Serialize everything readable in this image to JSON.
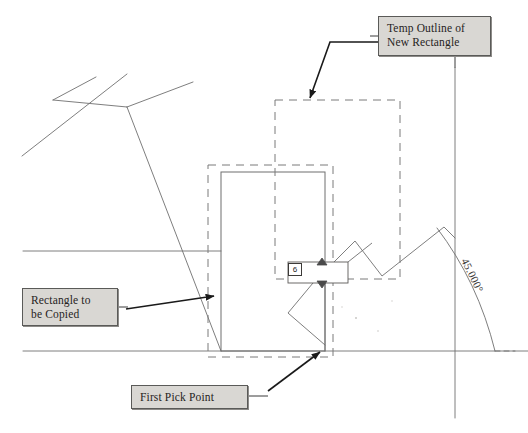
{
  "document": {
    "title": "Copy Rectangle Operation Diagram",
    "background_color": "#ffffff",
    "line_color": "#6b6b6b",
    "dash_color": "#7a7a7a",
    "arrow_color": "#1a1a1a",
    "callout_fill": "#d9d7d3",
    "callout_border": "#5a5a58"
  },
  "callouts": [
    {
      "id": "temp-outline",
      "text": "Temp Outline of\nNew Rectangle",
      "x": 378,
      "y": 16,
      "width": 113,
      "height": 40
    },
    {
      "id": "rectangle-to-be-copied",
      "text": "Rectangle to\nbe Copied",
      "x": 22,
      "y": 288,
      "width": 96,
      "height": 38
    },
    {
      "id": "first-pick-point",
      "text": "First Pick Point",
      "x": 131,
      "y": 385,
      "width": 117,
      "height": 24
    }
  ],
  "input_field": {
    "name": "coordinate-entry-field",
    "value": "6",
    "x": 288,
    "y": 263,
    "width": 14,
    "height": 13
  },
  "dimension": {
    "angle_label": "45.000°",
    "angle_degrees": 45
  },
  "geometry": {
    "source_rectangle": {
      "style": "solid",
      "x": 221,
      "y": 172,
      "width": 104,
      "height": 179
    },
    "source_selection_outline": {
      "style": "dashed",
      "x": 208,
      "y": 165,
      "width": 125,
      "height": 192
    },
    "temp_outline_rectangle": {
      "style": "dashed",
      "x": 275,
      "y": 100,
      "width": 125,
      "height": 179
    },
    "horizontal_baseline": {
      "y": 351,
      "x1": 23,
      "x2": 528
    },
    "horizontal_midline": {
      "y": 251,
      "x1": 23,
      "x2": 221
    },
    "vertical_reference_line": {
      "x": 455,
      "y1": 68,
      "y2": 418
    }
  },
  "polylines": {
    "upper_left_cross_a": [
      [
        22,
        156
      ],
      [
        127,
        74
      ]
    ],
    "upper_left_cross_b": [
      [
        53,
        100
      ],
      [
        96,
        77
      ]
    ],
    "upper_left_spine": [
      [
        53,
        100
      ],
      [
        127,
        107
      ]
    ],
    "upper_left_rise": [
      [
        127,
        107
      ],
      [
        193,
        82
      ]
    ],
    "leader_to_corner": [
      [
        127,
        107
      ],
      [
        221,
        351
      ]
    ],
    "zigzag_right": [
      [
        313,
        283
      ],
      [
        355,
        241
      ],
      [
        382,
        276
      ],
      [
        444,
        227
      ],
      [
        455,
        238
      ]
    ],
    "zigzag_lower": [
      [
        313,
        283
      ],
      [
        288,
        313
      ],
      [
        325,
        345
      ]
    ]
  },
  "arrows": [
    {
      "name": "arrow-temp-outline",
      "path": [
        [
          393,
          42
        ],
        [
          330,
          42
        ],
        [
          310,
          98
        ]
      ],
      "tip": [
        310,
        98
      ]
    },
    {
      "name": "arrow-rectangle-copied",
      "path": [
        [
          126,
          309
        ],
        [
          217,
          295
        ]
      ],
      "tip": [
        217,
        295
      ]
    },
    {
      "name": "arrow-first-pick",
      "path": [
        [
          269,
          390
        ],
        [
          322,
          350
        ]
      ],
      "tip": [
        322,
        350
      ]
    }
  ]
}
